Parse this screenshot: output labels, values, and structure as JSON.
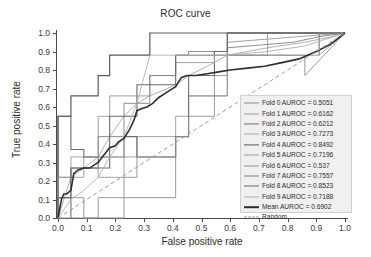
{
  "chart_data": {
    "type": "line",
    "title": "ROC curve",
    "xlabel": "False positive rate",
    "ylabel": "True positive rate",
    "xlim": [
      0.0,
      1.0
    ],
    "ylim": [
      0.0,
      1.0
    ],
    "grid": false,
    "legend_position": "lower right",
    "xticks": [
      "0.0",
      "0.1",
      "0.2",
      "0.3",
      "0.4",
      "0.5",
      "0.6",
      "0.7",
      "0.8",
      "0.9",
      "1.0"
    ],
    "yticks": [
      "0.0",
      "0.1",
      "0.2",
      "0.3",
      "0.4",
      "0.5",
      "0.6",
      "0.7",
      "0.8",
      "0.9",
      "1.0"
    ],
    "xtick_values": [
      0.0,
      0.1,
      0.2,
      0.3,
      0.4,
      0.5,
      0.6,
      0.7,
      0.8,
      0.9,
      1.0
    ],
    "ytick_values": [
      0.0,
      0.1,
      0.2,
      0.3,
      0.4,
      0.5,
      0.6,
      0.7,
      0.8,
      0.9,
      1.0
    ],
    "series": [
      {
        "name": "Fold 0 AUROC = 0.5051",
        "label": "Fold 0 AUROC = 0.5051",
        "auroc": 0.5051,
        "color": "#8c8c8c",
        "width": 0.9,
        "dash": "none",
        "x": [
          0.0,
          0.0,
          0.045,
          0.045,
          0.09,
          0.09,
          0.23,
          0.23,
          0.41,
          0.41,
          0.455,
          0.455,
          0.545,
          0.545,
          0.59,
          0.59,
          0.86,
          0.86,
          1.0
        ],
        "y": [
          0.0,
          0.0,
          0.0,
          0.11,
          0.11,
          0.0,
          0.0,
          0.11,
          0.11,
          0.44,
          0.44,
          0.66,
          0.66,
          0.77,
          0.77,
          0.88,
          0.88,
          0.77,
          1.0
        ]
      },
      {
        "name": "Fold 1 AUROC = 0.6162",
        "label": "Fold 1 AUROC = 0.6162",
        "auroc": 0.6162,
        "color": "#9a9a9a",
        "width": 0.9,
        "dash": "none",
        "x": [
          0.0,
          0.0,
          0.045,
          0.045,
          0.14,
          0.14,
          0.23,
          0.23,
          0.275,
          0.275,
          0.41,
          0.41,
          0.455,
          0.455,
          0.59,
          0.59,
          0.73,
          0.73,
          0.91,
          0.91,
          1.0
        ],
        "y": [
          0.0,
          0.22,
          0.22,
          0.33,
          0.33,
          0.22,
          0.22,
          0.33,
          0.33,
          0.44,
          0.44,
          0.55,
          0.55,
          0.66,
          0.66,
          0.88,
          0.88,
          1.0,
          1.0,
          0.88,
          1.0
        ]
      },
      {
        "name": "Fold 2 AUROC = 0.6212",
        "label": "Fold 2 AUROC = 0.6212",
        "auroc": 0.6212,
        "color": "#6e6e6e",
        "width": 1.1,
        "dash": "none",
        "x": [
          0.0,
          0.0,
          0.045,
          0.045,
          0.09,
          0.09,
          0.23,
          0.23,
          0.275,
          0.275,
          0.41,
          0.41,
          0.455,
          0.455,
          0.545,
          0.545,
          0.59,
          0.59,
          1.0
        ],
        "y": [
          0.0,
          0.55,
          0.55,
          0.37,
          0.37,
          0.33,
          0.33,
          0.44,
          0.44,
          0.33,
          0.33,
          0.44,
          0.44,
          0.77,
          0.77,
          0.88,
          0.88,
          1.0,
          1.0
        ]
      },
      {
        "name": "Fold 3 AUROC = 0.7273",
        "label": "Fold 3 AUROC = 0.7273",
        "auroc": 0.7273,
        "color": "#a8a8a8",
        "width": 0.9,
        "dash": "none",
        "x": [
          0.0,
          0.045,
          0.09,
          0.14,
          0.18,
          0.23,
          0.275,
          0.32,
          0.41,
          0.455,
          0.545,
          0.59,
          0.73,
          0.86,
          0.955,
          1.0
        ],
        "y": [
          0.0,
          0.22,
          0.27,
          0.33,
          0.44,
          0.55,
          0.62,
          0.66,
          0.72,
          0.77,
          0.84,
          0.88,
          0.92,
          0.95,
          0.98,
          1.0
        ]
      },
      {
        "name": "Fold 4 AUROC = 0.8492",
        "label": "Fold 4 AUROC = 0.8492",
        "auroc": 0.8492,
        "color": "#5a5a5a",
        "width": 1.2,
        "dash": "none",
        "x": [
          0.0,
          0.0,
          0.045,
          0.045,
          0.14,
          0.14,
          0.18,
          0.18,
          0.32,
          0.32,
          1.0
        ],
        "y": [
          0.0,
          0.55,
          0.55,
          0.66,
          0.66,
          0.77,
          0.77,
          0.88,
          0.88,
          1.0,
          1.0
        ]
      },
      {
        "name": "Fold 5 AUROC = 0.7196",
        "label": "Fold 5 AUROC = 0.7196",
        "auroc": 0.7196,
        "color": "#979797",
        "width": 0.9,
        "dash": "none",
        "x": [
          0.0,
          0.0,
          0.09,
          0.09,
          0.14,
          0.14,
          0.18,
          0.18,
          0.32,
          0.32,
          0.41,
          0.41,
          0.545,
          0.545,
          0.59,
          0.59,
          1.0
        ],
        "y": [
          0.0,
          0.22,
          0.22,
          0.33,
          0.33,
          0.55,
          0.55,
          0.66,
          0.66,
          0.77,
          0.77,
          0.84,
          0.84,
          0.88,
          0.88,
          0.95,
          1.0
        ]
      },
      {
        "name": "Fold 6 AUROC = 0.537",
        "label": "Fold 6 AUROC = 0.537",
        "auroc": 0.537,
        "color": "#8f8f8f",
        "width": 0.9,
        "dash": "none",
        "x": [
          0.0,
          0.0,
          0.045,
          0.045,
          0.14,
          0.14,
          0.23,
          0.23,
          0.275,
          0.275,
          0.41,
          0.41,
          0.455,
          0.455,
          0.545,
          0.545,
          0.59,
          0.59,
          0.91,
          0.91,
          1.0
        ],
        "y": [
          0.0,
          0.11,
          0.11,
          0.0,
          0.0,
          0.11,
          0.11,
          0.22,
          0.22,
          0.33,
          0.33,
          0.44,
          0.44,
          0.55,
          0.55,
          0.66,
          0.66,
          0.88,
          0.88,
          1.0,
          1.0
        ]
      },
      {
        "name": "Fold 7 AUROC = 0.7557",
        "label": "Fold 7 AUROC = 0.7557",
        "auroc": 0.7557,
        "color": "#828282",
        "width": 0.9,
        "dash": "none",
        "x": [
          0.0,
          0.0,
          0.045,
          0.045,
          0.14,
          0.14,
          0.23,
          0.23,
          0.32,
          0.32,
          0.41,
          0.41,
          0.455,
          0.455,
          0.59,
          0.59,
          0.82,
          0.91,
          1.0
        ],
        "y": [
          0.0,
          0.11,
          0.11,
          0.27,
          0.27,
          0.44,
          0.44,
          0.62,
          0.62,
          0.77,
          0.77,
          0.88,
          0.88,
          0.9,
          0.9,
          0.92,
          0.95,
          0.98,
          1.0
        ]
      },
      {
        "name": "Fold 8 AUROC = 0.8523",
        "label": "Fold 8 AUROC = 0.8523",
        "auroc": 0.8523,
        "color": "#6a6a6a",
        "width": 1.1,
        "dash": "none",
        "x": [
          0.0,
          0.0,
          0.045,
          0.045,
          0.18,
          0.18,
          0.275,
          0.275,
          0.41,
          0.41,
          0.545,
          0.545,
          0.59,
          0.59,
          1.0
        ],
        "y": [
          0.0,
          0.11,
          0.11,
          0.27,
          0.27,
          0.55,
          0.55,
          0.72,
          0.72,
          0.88,
          0.88,
          0.9,
          0.9,
          1.0,
          1.0
        ]
      },
      {
        "name": "Fold 9 AUROC = 0.7188",
        "label": "Fold 9 AUROC = 0.7188",
        "auroc": 0.7188,
        "color": "#b0b0b0",
        "width": 0.9,
        "dash": "none",
        "x": [
          0.0,
          0.045,
          0.09,
          0.14,
          0.18,
          0.23,
          0.275,
          0.32,
          0.41,
          0.5,
          0.59,
          0.73,
          0.86,
          1.0
        ],
        "y": [
          0.0,
          0.1,
          0.15,
          0.22,
          0.33,
          0.44,
          0.62,
          0.88,
          0.88,
          0.88,
          0.88,
          0.9,
          0.93,
          1.0
        ]
      },
      {
        "name": "Mean AUROC = 0.6902",
        "label": "Mean AUROC = 0.6902",
        "auroc": 0.6902,
        "color": "#2e2e2e",
        "width": 1.6,
        "dash": "none",
        "x": [
          0.0,
          0.012,
          0.02,
          0.03,
          0.045,
          0.055,
          0.07,
          0.09,
          0.11,
          0.14,
          0.16,
          0.18,
          0.2,
          0.21,
          0.23,
          0.25,
          0.265,
          0.275,
          0.29,
          0.31,
          0.33,
          0.35,
          0.38,
          0.41,
          0.43,
          0.45,
          0.48,
          0.52,
          0.56,
          0.6,
          0.66,
          0.72,
          0.78,
          0.84,
          0.9,
          0.95,
          1.0
        ],
        "y": [
          0.0,
          0.1,
          0.13,
          0.13,
          0.15,
          0.24,
          0.26,
          0.27,
          0.27,
          0.3,
          0.34,
          0.38,
          0.39,
          0.41,
          0.43,
          0.48,
          0.53,
          0.58,
          0.59,
          0.6,
          0.62,
          0.65,
          0.68,
          0.71,
          0.76,
          0.77,
          0.77,
          0.78,
          0.79,
          0.8,
          0.81,
          0.82,
          0.84,
          0.86,
          0.9,
          0.94,
          1.0
        ]
      },
      {
        "name": "Random",
        "label": "Random",
        "color": "#9b9b9b",
        "width": 1.0,
        "dash": "dashed",
        "x": [
          0.0,
          1.0
        ],
        "y": [
          0.0,
          1.0
        ]
      }
    ]
  },
  "legend": {
    "entries": [
      "Fold 0 AUROC = 0.5051",
      "Fold 1 AUROC = 0.6162",
      "Fold 2 AUROC = 0.6212",
      "Fold 3 AUROC = 0.7273",
      "Fold 4 AUROC = 0.8492",
      "Fold 5 AUROC = 0.7196",
      "Fold 6 AUROC = 0.537",
      "Fold 7 AUROC = 0.7557",
      "Fold 8 AUROC = 0.8523",
      "Fold 9 AUROC = 0.7188",
      "Mean AUROC = 0.6902",
      "Random"
    ]
  },
  "colors": {
    "background": "#ffffff",
    "axis": "#4a4a4a",
    "text": "#2b2b2b",
    "legend_background": "#f0f0f0",
    "legend_border": "#cfcfcf",
    "mean_line": "#2e2e2e",
    "random_line": "#9b9b9b"
  }
}
